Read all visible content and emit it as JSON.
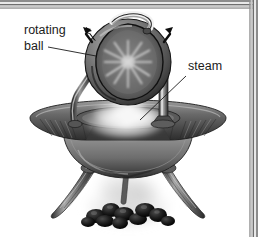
{
  "figure": {
    "background_color": "#ffffff",
    "ink_color": "#1b1b1b",
    "frame": {
      "name": "beveled-border",
      "sides": "top-and-right",
      "outer_color": "#8c8c8c",
      "mid_color": "#d8d8d8",
      "inner_color": "#6e6e6e"
    },
    "labels": [
      {
        "id": "rotating-ball",
        "line1": "rotating",
        "line2": "ball",
        "x": 24,
        "y": 34,
        "leader": "from 'ball' text rightward-up to the left edge of the sphere"
      },
      {
        "id": "steam",
        "line1": "steam",
        "line2": "",
        "x": 188,
        "y": 70,
        "leader": "from 'steam' text down-left to the steam plume above the cauldron"
      }
    ],
    "parts": [
      {
        "name": "rotating-ball",
        "description": "hollow bronze sphere, cut away to show interior steam jets"
      },
      {
        "name": "nozzle-pipe",
        "description": "curved bent pipe arcing over the top of the sphere"
      },
      {
        "name": "rotation-arrow-left",
        "description": "black arrowhead indicating spin direction"
      },
      {
        "name": "rotation-arrow-right",
        "description": "black arrowhead indicating spin direction"
      },
      {
        "name": "support-pillar-left",
        "description": "bent tubular standpipe carrying steam up to the ball"
      },
      {
        "name": "support-pillar-right",
        "description": "bent tubular standpipe carrying steam up to the ball"
      },
      {
        "name": "cauldron",
        "description": "wide shallow bronze vessel with flared fluted rim"
      },
      {
        "name": "steam-plume",
        "description": "white vapour rising from the cauldron mouth"
      },
      {
        "name": "leg-left",
        "description": "curved splayed fluted leg"
      },
      {
        "name": "leg-right",
        "description": "curved splayed fluted leg"
      },
      {
        "name": "coals",
        "description": "heap of dark burning coals beneath the cauldron"
      },
      {
        "name": "smoke",
        "description": "grey smoke rising from the coals"
      }
    ]
  }
}
